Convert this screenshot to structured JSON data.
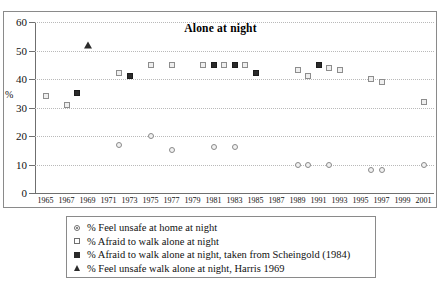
{
  "chart_data": {
    "type": "scatter",
    "title": "Alone at night",
    "xlabel": "",
    "ylabel": "%",
    "xlim": [
      1964,
      2002
    ],
    "ylim": [
      0,
      60
    ],
    "ytick_step": 10,
    "yticks": [
      0,
      10,
      20,
      30,
      40,
      50,
      60
    ],
    "xticks": [
      1965,
      1967,
      1969,
      1971,
      1973,
      1975,
      1977,
      1979,
      1981,
      1983,
      1985,
      1987,
      1989,
      1991,
      1993,
      1995,
      1997,
      1999,
      2001
    ],
    "grid": "horizontal-dotted",
    "legend_position": "below-plot",
    "series": [
      {
        "name": "% Feel unsafe at home at night",
        "marker": "open-circle",
        "points": [
          {
            "x": 1972,
            "y": 17
          },
          {
            "x": 1975,
            "y": 20
          },
          {
            "x": 1977,
            "y": 15
          },
          {
            "x": 1981,
            "y": 16
          },
          {
            "x": 1983,
            "y": 16
          },
          {
            "x": 1989,
            "y": 10
          },
          {
            "x": 1990,
            "y": 10
          },
          {
            "x": 1992,
            "y": 10
          },
          {
            "x": 1996,
            "y": 8
          },
          {
            "x": 1997,
            "y": 8
          },
          {
            "x": 2001,
            "y": 10
          }
        ]
      },
      {
        "name": "% Afraid to walk alone at night",
        "marker": "open-square",
        "points": [
          {
            "x": 1965,
            "y": 34
          },
          {
            "x": 1967,
            "y": 31
          },
          {
            "x": 1972,
            "y": 42
          },
          {
            "x": 1975,
            "y": 45
          },
          {
            "x": 1977,
            "y": 45
          },
          {
            "x": 1980,
            "y": 45
          },
          {
            "x": 1982,
            "y": 45
          },
          {
            "x": 1984,
            "y": 45
          },
          {
            "x": 1989,
            "y": 43
          },
          {
            "x": 1990,
            "y": 41
          },
          {
            "x": 1992,
            "y": 44
          },
          {
            "x": 1993,
            "y": 43
          },
          {
            "x": 1996,
            "y": 40
          },
          {
            "x": 1997,
            "y": 39
          },
          {
            "x": 2001,
            "y": 32
          }
        ]
      },
      {
        "name": "% Afraid to walk alone at night, taken from Scheingold (1984)",
        "marker": "filled-square",
        "points": [
          {
            "x": 1968,
            "y": 35
          },
          {
            "x": 1973,
            "y": 41
          },
          {
            "x": 1981,
            "y": 45
          },
          {
            "x": 1983,
            "y": 45
          },
          {
            "x": 1985,
            "y": 42
          },
          {
            "x": 1991,
            "y": 45
          }
        ]
      },
      {
        "name": "% Feel unsafe walk alone at night, Harris 1969",
        "marker": "filled-triangle",
        "points": [
          {
            "x": 1969,
            "y": 52
          }
        ]
      }
    ]
  },
  "legend": {
    "rows": [
      {
        "marker": "open-circle-dot",
        "label": "% Feel unsafe at home at night"
      },
      {
        "marker": "open-square",
        "label": "% Afraid to walk alone at night"
      },
      {
        "marker": "filled-square",
        "label": "% Afraid to walk alone at night, taken from Scheingold (1984)"
      },
      {
        "marker": "filled-triangle",
        "label": "% Feel unsafe walk alone at night, Harris 1969"
      }
    ]
  }
}
